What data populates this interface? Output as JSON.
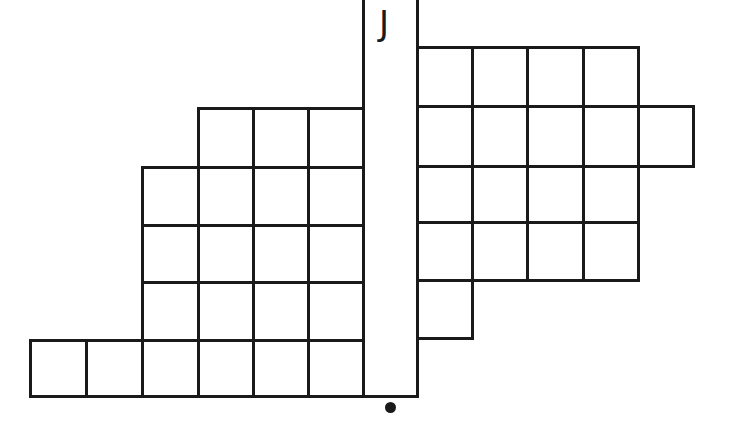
{
  "diagram": {
    "type": "grid-tiling",
    "line_color": "#1a1a1a",
    "background": "#ffffff",
    "strip": {
      "label": "J",
      "x": 363,
      "y": 0,
      "width": 54,
      "height": 396
    },
    "marker": {
      "shape": "dot",
      "x": 390,
      "y": 407
    },
    "left_region": {
      "col_edges": [
        30,
        86,
        142,
        198,
        253,
        308,
        363
      ],
      "rows": [
        {
          "top": 108,
          "bottom": 167,
          "from_col": 3,
          "to_col": 6,
          "cells": 3
        },
        {
          "top": 167,
          "bottom": 225,
          "from_col": 2,
          "to_col": 6,
          "cells": 4
        },
        {
          "top": 225,
          "bottom": 282,
          "from_col": 2,
          "to_col": 6,
          "cells": 4
        },
        {
          "top": 282,
          "bottom": 340,
          "from_col": 2,
          "to_col": 6,
          "cells": 4
        },
        {
          "top": 340,
          "bottom": 396,
          "from_col": 0,
          "to_col": 6,
          "cells": 6
        }
      ]
    },
    "right_region": {
      "col_edges": [
        417,
        472,
        527,
        583,
        638,
        693
      ],
      "rows": [
        {
          "top": 47,
          "bottom": 106,
          "from_col": 0,
          "to_col": 4,
          "cells": 4
        },
        {
          "top": 106,
          "bottom": 166,
          "from_col": 0,
          "to_col": 5,
          "cells": 5
        },
        {
          "top": 166,
          "bottom": 222,
          "from_col": 0,
          "to_col": 4,
          "cells": 4
        },
        {
          "top": 222,
          "bottom": 280,
          "from_col": 0,
          "to_col": 4,
          "cells": 4
        },
        {
          "top": 280,
          "bottom": 338,
          "from_col": 0,
          "to_col": 1,
          "cells": 1
        }
      ]
    },
    "total_cells_left": 21,
    "total_cells_right": 18
  }
}
